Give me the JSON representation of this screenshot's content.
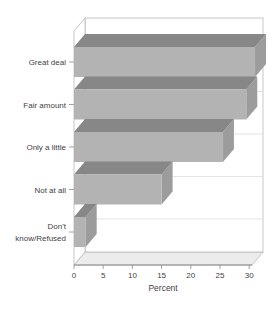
{
  "chart_data": {
    "type": "bar",
    "orientation": "horizontal",
    "style": "3d-block",
    "title": "",
    "categories": [
      "Great deal",
      "Fair amount",
      "Only a little",
      "Not at all",
      "Don't know/Refused"
    ],
    "label_lines": [
      [
        "Great deal"
      ],
      [
        "Fair amount"
      ],
      [
        "Only a little"
      ],
      [
        "Not at all"
      ],
      [
        "Don't",
        "know/Refused"
      ]
    ],
    "values": [
      31,
      29.5,
      25.5,
      15,
      2
    ],
    "xlabel": "Percent",
    "x_ticks": [
      0,
      5,
      10,
      15,
      20,
      25,
      30
    ],
    "xlim": [
      0,
      30.5
    ],
    "legend": "none",
    "grid": "horizontal-category-lines-on-back-wall",
    "colors": {
      "background": "#ffffff",
      "bar_front": "#b3b3b3",
      "bar_top": "#878787",
      "bar_side": "#9c9c9c",
      "floor": "#ececec",
      "wall_fill": "#ffffff",
      "wall_stroke": "#b8b8b8",
      "gridline": "#dcdcdc",
      "axis": "#8c8c8c",
      "text": "#3f3f3f"
    }
  }
}
